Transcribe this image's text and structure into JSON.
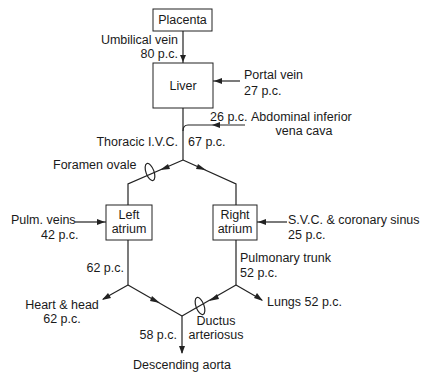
{
  "nodes": {
    "placenta": "Placenta",
    "liver": "Liver",
    "left_atrium_1": "Left",
    "left_atrium_2": "atrium",
    "right_atrium_1": "Right",
    "right_atrium_2": "atrium"
  },
  "labels": {
    "umbilical_vein": "Umbilical vein",
    "umbilical_pc": "80 p.c.",
    "portal_vein": "Portal vein",
    "portal_pc": "27 p.c.",
    "abd_ivc_pc": "26 p.c.",
    "abd_ivc_1": "Abdominal inferior",
    "abd_ivc_2": "vena cava",
    "thoracic_ivc": "Thoracic I.V.C.",
    "thoracic_pc": "67 p.c.",
    "foramen_ovale": "Foramen ovale",
    "pulm_veins": "Pulm. veins",
    "pulm_veins_pc": "42 p.c.",
    "svc_1": "S.V.C. & coronary sinus",
    "svc_pc": "25 p.c.",
    "left_out_pc": "62 p.c.",
    "pulm_trunk": "Pulmonary trunk",
    "pulm_trunk_pc": "52 p.c.",
    "heart_head": "Heart & head",
    "heart_head_pc": "62 p.c.",
    "lungs": "Lungs 52 p.c.",
    "aorta_pc": "58 p.c.",
    "ductus_1": "Ductus",
    "ductus_2": "arteriosus",
    "descending_aorta": "Descending aorta"
  }
}
